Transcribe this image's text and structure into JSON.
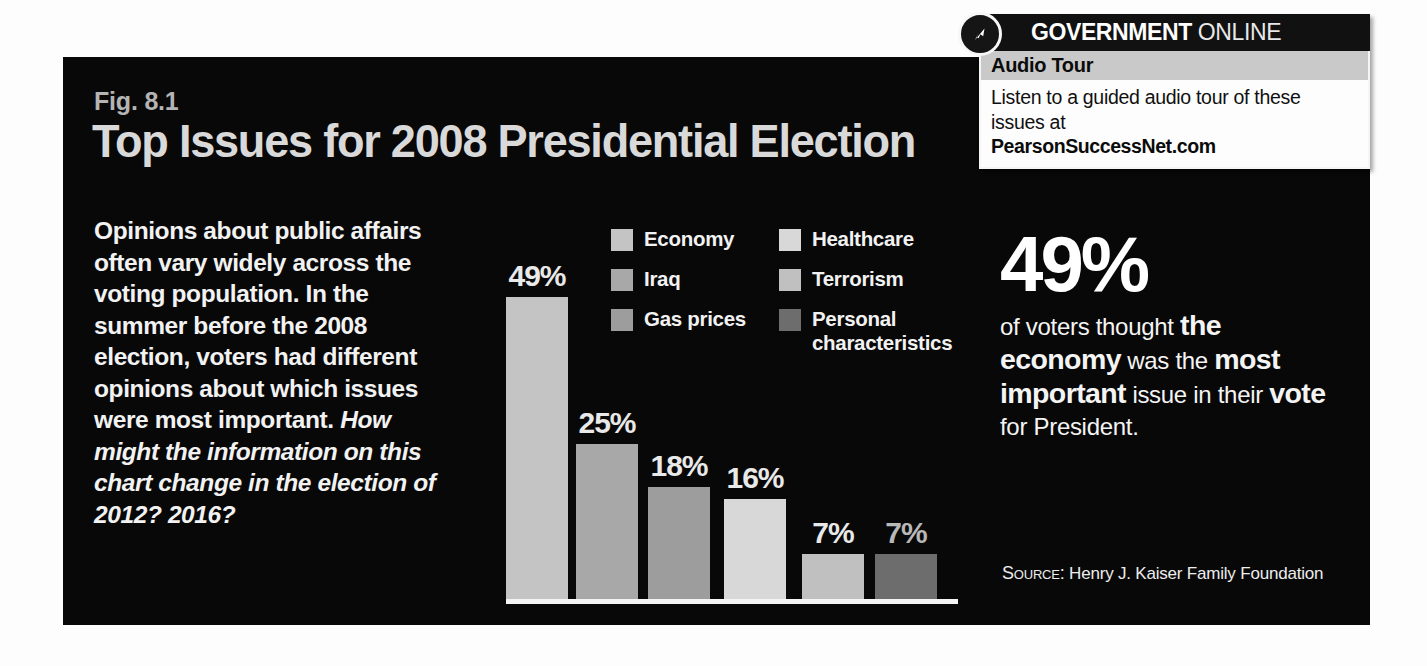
{
  "figure": {
    "number": "Fig. 8.1",
    "title": "Top Issues for 2008 Presidential Election",
    "lead_intro": "Opinions about public affairs often vary widely across the voting population. In the summer before the 2008 election, voters had different opinions about which issues were most important. ",
    "lead_question": "How might the information on this chart change in the election of 2012? 2016?",
    "source": "Henry J. Kaiser Family Foundation",
    "source_prefix": "Source:"
  },
  "callout": {
    "brand_bold": "GOVERNMENT",
    "brand_thin": "ONLINE",
    "band_title": "Audio Tour",
    "body": "Listen to a guided audio tour of these issues at",
    "url": "PearsonSuccessNet.com",
    "icon": "cursor-arrow-icon"
  },
  "pull_quote": {
    "number": "49%",
    "part1": "of voters thought ",
    "part2_bold": "the economy",
    "part3": " was the ",
    "part4_bold": "most important",
    "part5": " issue in their ",
    "part6_bold": "vote",
    "part7": " for President."
  },
  "colors": {
    "panel_background": "#080808",
    "title": "#d9d9d9",
    "fig_number": "#b4b4b4",
    "baseline": "#f4f4f4",
    "economy": "#c4c4c4",
    "iraq": "#a8a8a8",
    "gas_prices": "#9d9d9d",
    "healthcare": "#d8d8d8",
    "terrorism": "#c0c0c0",
    "personal_characteristics": "#6d6d6d",
    "callout_band": "#c9c9c9",
    "callout_header": "#111111"
  },
  "chart_data": {
    "type": "bar",
    "title": "Top Issues for 2008 Presidential Election",
    "xlabel": "",
    "ylabel": "",
    "ylim": [
      0,
      55
    ],
    "grid": false,
    "legend_position": "inside-top-right",
    "source": "Henry J. Kaiser Family Foundation",
    "categories": [
      "Economy",
      "Iraq",
      "Gas prices",
      "Healthcare",
      "Terrorism",
      "Personal characteristics"
    ],
    "values": [
      49,
      25,
      18,
      16,
      7,
      7
    ],
    "value_labels": [
      "49%",
      "25%",
      "18%",
      "16%",
      "7%",
      "7%"
    ],
    "colors": [
      "#c4c4c4",
      "#a8a8a8",
      "#9d9d9d",
      "#d8d8d8",
      "#c0c0c0",
      "#6d6d6d"
    ],
    "bars": [
      {
        "label": "Economy",
        "value": 49,
        "display": "49%",
        "color": "#c4c4c4",
        "height_px": 305,
        "left_px": 6
      },
      {
        "label": "Iraq",
        "value": 25,
        "display": "25%",
        "color": "#a8a8a8",
        "height_px": 158,
        "left_px": 76
      },
      {
        "label": "Gas prices",
        "value": 18,
        "display": "18%",
        "color": "#9d9d9d",
        "height_px": 115,
        "left_px": 148
      },
      {
        "label": "Healthcare",
        "value": 16,
        "display": "16%",
        "color": "#d8d8d8",
        "height_px": 103,
        "left_px": 224
      },
      {
        "label": "Terrorism",
        "value": 7,
        "display": "7%",
        "color": "#c0c0c0",
        "height_px": 48,
        "left_px": 302
      },
      {
        "label": "Personal characteristics",
        "value": 7,
        "display": "7%",
        "color": "#6d6d6d",
        "height_px": 48,
        "left_px": 375
      }
    ],
    "legend": [
      {
        "label": "Economy",
        "color": "#c4c4c4"
      },
      {
        "label": "Iraq",
        "color": "#a8a8a8"
      },
      {
        "label": "Gas prices",
        "color": "#9d9d9d"
      },
      {
        "label": "Healthcare",
        "color": "#d8d8d8"
      },
      {
        "label": "Terrorism",
        "color": "#c0c0c0"
      },
      {
        "label": "Personal characteristics",
        "color": "#6d6d6d"
      }
    ]
  }
}
